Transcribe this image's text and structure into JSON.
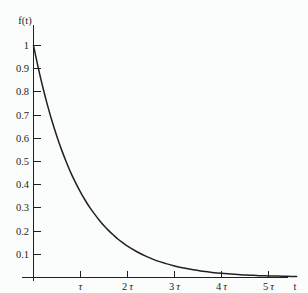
{
  "chart_data": {
    "type": "line",
    "title": "",
    "subtitle": "",
    "xlabel": "t",
    "ylabel": "f(t)",
    "function": "f(t) = e^(-t/τ)",
    "xlim": [
      0,
      5.6
    ],
    "ylim": [
      0,
      1.05
    ],
    "grid": false,
    "legend_position": "none",
    "x_tick_labels": [
      "τ",
      "2 τ",
      "3 τ",
      "4 τ",
      "5 τ"
    ],
    "x_tick_values": [
      1,
      2,
      3,
      4,
      5
    ],
    "y_tick_labels": [
      "0.1",
      "0.2",
      "0.3",
      "0.4",
      "0.5",
      "0.6",
      "0.7",
      "0.8",
      "0.9",
      "1"
    ],
    "y_tick_values": [
      0.1,
      0.2,
      0.3,
      0.4,
      0.5,
      0.6,
      0.7,
      0.8,
      0.9,
      1.0
    ],
    "series": [
      {
        "name": "f(t) = e^(-t/τ)",
        "x": [
          0,
          0.1,
          0.2,
          0.3,
          0.4,
          0.5,
          0.6,
          0.7,
          0.8,
          0.9,
          1.0,
          1.1,
          1.2,
          1.3,
          1.4,
          1.5,
          1.6,
          1.7,
          1.8,
          1.9,
          2.0,
          2.2,
          2.4,
          2.6,
          2.8,
          3.0,
          3.2,
          3.4,
          3.6,
          3.8,
          4.0,
          4.2,
          4.4,
          4.6,
          4.8,
          5.0,
          5.2,
          5.4,
          5.6
        ],
        "values": [
          1.0,
          0.905,
          0.819,
          0.741,
          0.67,
          0.607,
          0.549,
          0.497,
          0.449,
          0.407,
          0.368,
          0.333,
          0.301,
          0.273,
          0.247,
          0.223,
          0.202,
          0.183,
          0.165,
          0.15,
          0.135,
          0.111,
          0.091,
          0.074,
          0.061,
          0.05,
          0.041,
          0.033,
          0.027,
          0.022,
          0.018,
          0.015,
          0.012,
          0.01,
          0.008,
          0.007,
          0.006,
          0.005,
          0.004
        ]
      }
    ],
    "colors": {
      "curve": "#231f20",
      "axis": "#231f20",
      "background": "#fbfcfc"
    }
  },
  "labels": {
    "y_axis_title": "f(t)",
    "x_axis_title": "t",
    "y_1": "1",
    "y_09": "0.9",
    "y_08": "0.8",
    "y_07": "0.7",
    "y_06": "0.6",
    "y_05": "0.5",
    "y_04": "0.4",
    "y_03": "0.3",
    "y_02": "0.2",
    "y_01": "0.1",
    "x_1tau_num": "",
    "x_1tau_sym": "τ",
    "x_2tau_num": "2",
    "x_2tau_sym": "τ",
    "x_3tau_num": "3",
    "x_3tau_sym": "τ",
    "x_4tau_num": "4",
    "x_4tau_sym": "τ",
    "x_5tau_num": "5",
    "x_5tau_sym": "τ"
  }
}
